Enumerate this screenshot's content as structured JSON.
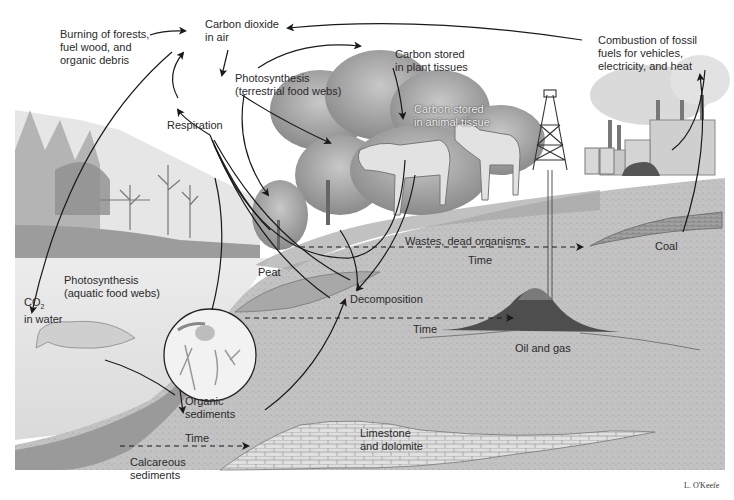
{
  "diagram": {
    "labels": {
      "co2_air": "Carbon dioxide\nin air",
      "burning": "Burning of forests,\nfuel wood, and\norganic debris",
      "combustion": "Combustion of fossil\nfuels for vehicles,\nelectricity, and heat",
      "photo_terrestrial": "Photosynthesis\n(terrestrial food webs)",
      "carbon_plant": "Carbon stored\nin plant tissues",
      "carbon_animal": "Carbon stored\nin animal tissue",
      "respiration": "Respiration",
      "wastes": "Wastes, dead organisms",
      "time_1": "Time",
      "coal": "Coal",
      "peat": "Peat",
      "photo_aquatic": "Photosynthesis\n(aquatic food webs)",
      "co2_water_main": "CO",
      "co2_water_sub": "2",
      "co2_water_rest": "in water",
      "decomposition": "Decomposition",
      "time_2": "Time",
      "oil_gas": "Oil and gas",
      "organic_sediments": "Organic\nsediments",
      "time_3": "Time",
      "limestone": "Limestone\nand dolomite",
      "calcareous": "Calcareous\nsediments",
      "signature": "L. O'Keefe"
    },
    "colors": {
      "sky": "#ffffff",
      "ground": "#bdbdbd",
      "water": "#e4e4e4",
      "trees": "#9a9a9a",
      "arrow": "#1a1a1a",
      "text": "#2a2a2a"
    }
  }
}
